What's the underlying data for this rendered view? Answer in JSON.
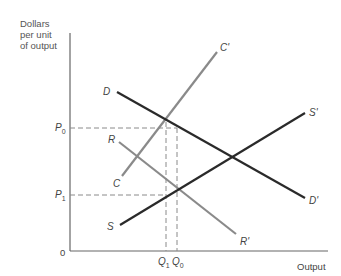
{
  "diagram": {
    "y_axis_title": "Dollars\nper unit\nof output",
    "x_axis_title": "Output",
    "origin_label": "0",
    "price_labels": [
      {
        "base": "P",
        "sub": "0"
      },
      {
        "base": "P",
        "sub": "1"
      }
    ],
    "quantity_labels": [
      {
        "base": "Q",
        "sub": "1"
      },
      {
        "base": "Q",
        "sub": "0"
      }
    ],
    "curves": [
      {
        "name": "D",
        "start_label": "D",
        "end_label": "D'",
        "color": "#2a2a2a",
        "description": "Demand curve, downward sloping"
      },
      {
        "name": "S",
        "start_label": "S",
        "end_label": "S'",
        "color": "#2a2a2a",
        "description": "Supply curve, upward sloping"
      },
      {
        "name": "C",
        "start_label": "C",
        "end_label": "C'",
        "color": "#8a8a8a",
        "description": "Steep upward sloping gray curve"
      },
      {
        "name": "R",
        "start_label": "R",
        "end_label": "R'",
        "color": "#8a8a8a",
        "description": "Downward sloping gray curve"
      }
    ],
    "guide_color": "#8a8a8a",
    "axis_color": "#666666"
  }
}
